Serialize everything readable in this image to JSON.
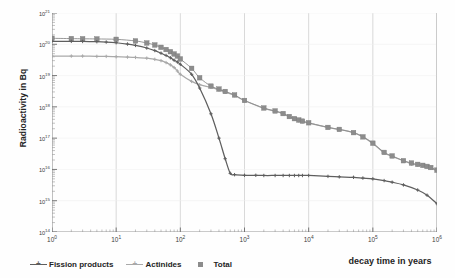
{
  "chart_data": {
    "type": "line",
    "title": "",
    "xlabel": "decay time in years",
    "ylabel": "Radioactivity in Bq",
    "xscale": "log",
    "yscale": "log",
    "xlim": [
      1,
      1000000
    ],
    "ylim": [
      100000000000000.0,
      1e+21
    ],
    "grid": "vertical decade gridlines",
    "legend_position": "bottom-left",
    "x_tick_labels": [
      "10^0",
      "10^1",
      "10^2",
      "10^3",
      "10^4",
      "10^5",
      "10^6"
    ],
    "x_tick_values": [
      1,
      10,
      100,
      1000,
      10000,
      100000,
      1000000
    ],
    "y_tick_labels": [
      "10^21",
      "10^20",
      "10^19",
      "10^18",
      "10^17",
      "10^16",
      "10^15",
      "10^14"
    ],
    "y_tick_values": [
      1e+21,
      1e+20,
      1e+19,
      1e+18,
      1e+17,
      1e+16,
      1000000000000000.0,
      100000000000000.0
    ],
    "series": [
      {
        "name": "Fission products",
        "color": "#5e5e5e",
        "marker": "plus",
        "points": [
          [
            1,
            1.25e+20
          ],
          [
            2,
            1.24e+20
          ],
          [
            3,
            1.23e+20
          ],
          [
            5,
            1.21e+20
          ],
          [
            7,
            1.18e+20
          ],
          [
            10,
            1.12e+20
          ],
          [
            15,
            1.02e+20
          ],
          [
            20,
            9.2e+19
          ],
          [
            30,
            7.6e+19
          ],
          [
            40,
            6.3e+19
          ],
          [
            50,
            5.2e+19
          ],
          [
            60,
            4.4e+19
          ],
          [
            70,
            3.7e+19
          ],
          [
            80,
            3.1e+19
          ],
          [
            90,
            2.7e+19
          ],
          [
            100,
            2.3e+19
          ],
          [
            150,
            1.1e+19
          ],
          [
            200,
            4e+18
          ],
          [
            300,
            6e+17
          ],
          [
            400,
            1e+17
          ],
          [
            500,
            2.2e+16
          ],
          [
            600,
            7500000000000000.0
          ],
          [
            700,
            6800000000000000.0
          ],
          [
            1000,
            6500000000000000.0
          ],
          [
            1500,
            6500000000000000.0
          ],
          [
            2000,
            6400000000000000.0
          ],
          [
            3000,
            6400000000000000.0
          ],
          [
            4000,
            6400000000000000.0
          ],
          [
            5000,
            6400000000000000.0
          ],
          [
            6000,
            6400000000000000.0
          ],
          [
            7000,
            6400000000000000.0
          ],
          [
            8000,
            6400000000000000.0
          ],
          [
            10000,
            6400000000000000.0
          ],
          [
            20000,
            6000000000000000.0
          ],
          [
            30000,
            5800000000000000.0
          ],
          [
            50000,
            5600000000000000.0
          ],
          [
            70000,
            5300000000000000.0
          ],
          [
            100000,
            5000000000000000.0
          ],
          [
            150000,
            4400000000000000.0
          ],
          [
            200000,
            3900000000000000.0
          ],
          [
            300000,
            3200000000000000.0
          ],
          [
            500000,
            2200000000000000.0
          ],
          [
            700000,
            1500000000000000.0
          ],
          [
            1000000,
            800000000000000.0
          ]
        ]
      },
      {
        "name": "Actinides",
        "color": "#a9a9a9",
        "marker": "plus",
        "points": [
          [
            1,
            4.2e+19
          ],
          [
            2,
            4.2e+19
          ],
          [
            3,
            4.2e+19
          ],
          [
            5,
            4.1e+19
          ],
          [
            7,
            4.1e+19
          ],
          [
            10,
            4e+19
          ],
          [
            15,
            3.9e+19
          ],
          [
            20,
            3.8e+19
          ],
          [
            30,
            3.6e+19
          ],
          [
            40,
            3.3e+19
          ],
          [
            50,
            3e+19
          ],
          [
            60,
            2.6e+19
          ],
          [
            70,
            2.2e+19
          ],
          [
            80,
            1.8e+19
          ],
          [
            90,
            1.4e+19
          ],
          [
            100,
            1.1e+19
          ],
          [
            150,
            6.5e+18
          ],
          [
            200,
            5.1e+18
          ],
          [
            300,
            4.2e+18
          ],
          [
            400,
            3.5e+18
          ],
          [
            500,
            3e+18
          ],
          [
            700,
            2.3e+18
          ],
          [
            1000,
            1.6e+18
          ],
          [
            2000,
            9e+17
          ],
          [
            3000,
            7.3e+17
          ],
          [
            4000,
            6e+17
          ],
          [
            5000,
            4.8e+17
          ],
          [
            6000,
            4e+17
          ],
          [
            7000,
            3.6e+17
          ],
          [
            8000,
            3.4e+17
          ],
          [
            10000,
            3e+17
          ],
          [
            20000,
            2.2e+17
          ],
          [
            30000,
            1.9e+17
          ],
          [
            50000,
            1.5e+17
          ],
          [
            70000,
            1.1e+17
          ],
          [
            100000,
            6.8e+16
          ],
          [
            150000,
            3.4e+16
          ],
          [
            200000,
            2.6e+16
          ],
          [
            300000,
            1.9e+16
          ],
          [
            400000,
            1.5e+16
          ],
          [
            500000,
            1.4e+16
          ],
          [
            600000,
            1.3e+16
          ],
          [
            700000,
            1.2e+16
          ],
          [
            800000,
            1.1e+16
          ],
          [
            1000000,
            9000000000000000.0
          ]
        ]
      },
      {
        "name": "Total",
        "color": "#8c8c8c",
        "marker": "square",
        "points": [
          [
            1,
            1.55e+20
          ],
          [
            2,
            1.52e+20
          ],
          [
            3,
            1.5e+20
          ],
          [
            5,
            1.48e+20
          ],
          [
            10,
            1.44e+20
          ],
          [
            20,
            1.28e+20
          ],
          [
            30,
            1.1e+20
          ],
          [
            40,
            9.5e+19
          ],
          [
            50,
            8e+19
          ],
          [
            60,
            6.8e+19
          ],
          [
            70,
            5.8e+19
          ],
          [
            80,
            4.9e+19
          ],
          [
            90,
            4.2e+19
          ],
          [
            100,
            3.4e+19
          ],
          [
            150,
            1.7e+19
          ],
          [
            200,
            8.5e+18
          ],
          [
            300,
            4.6e+18
          ],
          [
            400,
            3.7e+18
          ],
          [
            500,
            3.1e+18
          ],
          [
            700,
            2.4e+18
          ],
          [
            1000,
            1.6e+18
          ],
          [
            2000,
            9.2e+17
          ],
          [
            3000,
            7.4e+17
          ],
          [
            4000,
            6.1e+17
          ],
          [
            5000,
            4.9e+17
          ],
          [
            6000,
            4.2e+17
          ],
          [
            7000,
            3.8e+17
          ],
          [
            8000,
            3.5e+17
          ],
          [
            10000,
            3.1e+17
          ],
          [
            20000,
            2.2e+17
          ],
          [
            30000,
            1.9e+17
          ],
          [
            50000,
            1.5e+17
          ],
          [
            70000,
            1.1e+17
          ],
          [
            100000,
            6.9e+16
          ],
          [
            150000,
            3.5e+16
          ],
          [
            200000,
            2.7e+16
          ],
          [
            300000,
            1.9e+16
          ],
          [
            400000,
            1.6e+16
          ],
          [
            500000,
            1.45e+16
          ],
          [
            600000,
            1.35e+16
          ],
          [
            700000,
            1.25e+16
          ],
          [
            800000,
            1.15e+16
          ],
          [
            1000000,
            9500000000000000.0
          ]
        ]
      }
    ]
  },
  "legend": {
    "items": [
      {
        "label": "Fission products",
        "marker": "line-plus",
        "color": "#5e5e5e"
      },
      {
        "label": "Actinides",
        "marker": "line-plus",
        "color": "#a9a9a9"
      },
      {
        "label": "Total",
        "marker": "square",
        "color": "#8c8c8c"
      }
    ]
  },
  "colors": {
    "fission": "#5e5e5e",
    "actinides": "#a9a9a9",
    "total": "#8c8c8c",
    "grid": "#cfcfcf",
    "axis": "#9a9a9a",
    "text": "#2b2b2b",
    "background": "#fefefe"
  }
}
